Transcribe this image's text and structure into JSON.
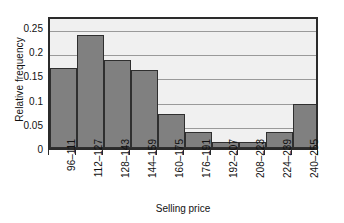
{
  "chart_data": {
    "type": "bar",
    "title": "",
    "xlabel": "Selling price",
    "ylabel": "Relative frequency",
    "categories": [
      "96–111",
      "112–127",
      "128–143",
      "144–159",
      "160–175",
      "176–191",
      "192–207",
      "208–223",
      "224–239",
      "240–255"
    ],
    "values": [
      0.165,
      0.233,
      0.182,
      0.162,
      0.07,
      0.033,
      0.013,
      0.013,
      0.033,
      0.092
    ],
    "ylim": [
      0,
      0.275
    ],
    "yticks": [
      0,
      0.05,
      0.1,
      0.15,
      0.2,
      0.25
    ],
    "ytick_labels": [
      "0",
      "0.05",
      "0.1",
      "0.15",
      "0.2",
      "0.25"
    ],
    "grid": "horizontal",
    "legend": "none",
    "bar_fill_color": "#808080",
    "bar_edge_color": "#2f2f2f",
    "plot_background_color": "#f0f0f0",
    "gridline_color": "#9a9a9a",
    "frame_color": "#2b2b2b"
  }
}
